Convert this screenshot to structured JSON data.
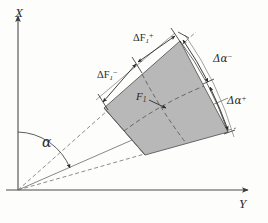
{
  "figure": {
    "background_color": "#fdfdfc",
    "fill_color": "#b8b8b8",
    "line_color": "#3a3a3a",
    "axes": {
      "x_label": "X",
      "y_label": "Y",
      "origin_label": ""
    },
    "angle": {
      "label": "α",
      "name": "alpha-angle"
    },
    "annotations": [
      {
        "name": "delta-f-plus",
        "base": "ΔF",
        "sub": "1",
        "sup": "+",
        "text": "ΔF₁⁺"
      },
      {
        "name": "delta-f-minus",
        "base": "ΔF",
        "sub": "1",
        "sup": "−",
        "text": "ΔF₁⁻"
      },
      {
        "name": "delta-alpha-minus",
        "base": "Δα",
        "sub": "",
        "sup": "−",
        "text": "Δα⁻"
      },
      {
        "name": "delta-alpha-plus",
        "base": "Δα",
        "sub": "",
        "sup": "+",
        "text": "Δα⁺"
      },
      {
        "name": "center-point",
        "base": "F",
        "sub": "1",
        "sup": "",
        "text": "F₁"
      }
    ],
    "labels": {
      "x_axis": "X",
      "y_axis": "Y",
      "alpha": "α",
      "delta_f_plus_base": "ΔF",
      "delta_f_plus_sub": "1",
      "delta_f_plus_sup": "+",
      "delta_f_minus_base": "ΔF",
      "delta_f_minus_sub": "1",
      "delta_f_minus_sup": "−",
      "delta_alpha_minus_base": "Δα",
      "delta_alpha_minus_sup": "−",
      "delta_alpha_plus_base": "Δα",
      "delta_alpha_plus_sup": "+",
      "center_base": "F",
      "center_sub": "1"
    }
  }
}
